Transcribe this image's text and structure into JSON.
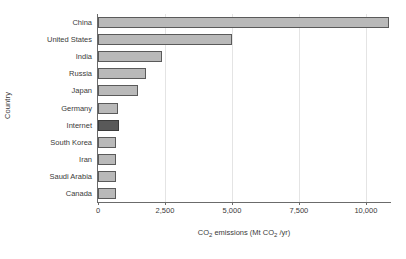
{
  "chart_data": {
    "type": "bar",
    "orientation": "horizontal",
    "title": "",
    "xlabel": "CO₂ emissions (Mt CO₂ /yr)",
    "ylabel": "Country",
    "categories": [
      "China",
      "United States",
      "India",
      "Russia",
      "Japan",
      "Germany",
      "Internet",
      "South Korea",
      "Iran",
      "Saudi Arabia",
      "Canada"
    ],
    "values": [
      10860,
      5000,
      2400,
      1790,
      1490,
      760,
      780,
      680,
      670,
      660,
      670
    ],
    "xlim": [
      0,
      10900
    ],
    "ylim": null,
    "xticks": [
      0,
      2500,
      5000,
      7500,
      10000
    ],
    "xtick_labels": [
      "0",
      "2,500",
      "5,000",
      "7,500",
      "10,000"
    ],
    "grid": "vertical-only",
    "legend": "none",
    "highlight_category": "Internet",
    "bar_color": "#b9b9b9",
    "bar_edge_color": "#5a5a5a",
    "highlight_color": "#595959",
    "highlight_edge_color": "#3b3b3b",
    "gridline_color": "#e4e4e4",
    "axis_color": "#6b6b6b",
    "background_color": "#ffffff"
  }
}
